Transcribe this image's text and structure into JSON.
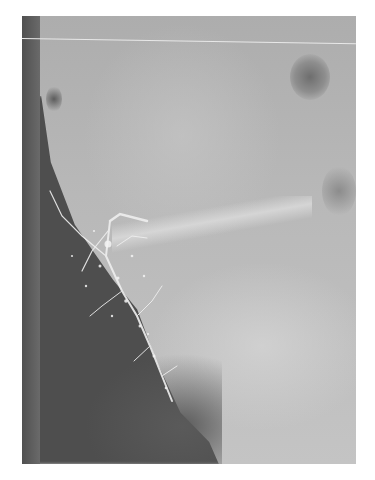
{
  "image": {
    "kind": "radiograph",
    "modality": "X-ray (lateral view, contrast sialogram appearance)",
    "colors": {
      "background": "#ffffff",
      "bone_field": "#b8b8b8",
      "soft_tissue_dark": "#4e4e4e",
      "contrast_duct": "#f2f2f2",
      "scan_line": "#e8e8e8"
    },
    "frame": {
      "x": 22,
      "y": 16,
      "width": 334,
      "height": 448
    },
    "regions": [
      {
        "name": "dark-air-column",
        "position": "left edge"
      },
      {
        "name": "soft-tissue-dark-region",
        "position": "lower left"
      },
      {
        "name": "contrast-filled-ducts",
        "position": "center-left, branching diagonally downward"
      },
      {
        "name": "bony-structures",
        "position": "right and upper areas"
      },
      {
        "name": "orbit-like-lucency",
        "position": "upper right"
      },
      {
        "name": "horizontal-scan-line",
        "position": "near top"
      }
    ],
    "alt": "Grayscale X-ray showing branching contrast-filled ducts along dark soft tissue on the left side"
  }
}
